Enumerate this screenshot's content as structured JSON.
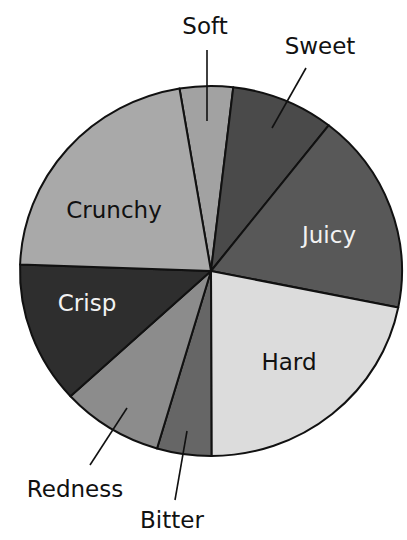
{
  "chart_data": {
    "type": "pie",
    "title": "",
    "start_angle_deg": -9.5,
    "direction": "clockwise",
    "slices": [
      {
        "label": "Soft",
        "value": 4.5,
        "color": "#a2a2a2",
        "label_style": "outside",
        "label_color": "#111111"
      },
      {
        "label": "Sweet",
        "value": 8.7,
        "color": "#4a4a4a",
        "label_style": "outside",
        "label_color": "#111111"
      },
      {
        "label": "Juicy",
        "value": 17.6,
        "color": "#585858",
        "label_style": "inside",
        "label_color": "#f2f2f2"
      },
      {
        "label": "Hard",
        "value": 21.8,
        "color": "#dcdcdc",
        "label_style": "inside",
        "label_color": "#111111"
      },
      {
        "label": "Bitter",
        "value": 4.6,
        "color": "#666666",
        "label_style": "outside",
        "label_color": "#111111"
      },
      {
        "label": "Redness",
        "value": 8.6,
        "color": "#8c8c8c",
        "label_style": "outside",
        "label_color": "#111111"
      },
      {
        "label": "Crisp",
        "value": 12.4,
        "color": "#2e2e2e",
        "label_style": "inside",
        "label_color": "#f2f2f2"
      },
      {
        "label": "Crunchy",
        "value": 21.8,
        "color": "#a9a9a9",
        "label_style": "inside",
        "label_color": "#111111"
      }
    ],
    "legend": "none",
    "units": "percent"
  },
  "labels": {
    "soft": "Soft",
    "sweet": "Sweet",
    "juicy": "Juicy",
    "hard": "Hard",
    "bitter": "Bitter",
    "redness": "Redness",
    "crisp": "Crisp",
    "crunchy": "Crunchy"
  }
}
